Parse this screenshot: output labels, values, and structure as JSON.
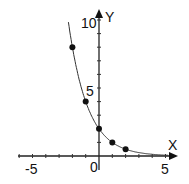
{
  "chart_data": {
    "type": "line",
    "title": "",
    "xlabel": "X",
    "ylabel": "Y",
    "x_ticks_labeled": [
      "-5",
      "0",
      "5"
    ],
    "y_ticks_labeled": [
      "5",
      "10"
    ],
    "xlim": [
      -6,
      5.5
    ],
    "ylim": [
      0,
      10.5
    ],
    "grid": false,
    "curve": "y = 2*(1/2)^x",
    "points": [
      {
        "x": -2,
        "y": 8
      },
      {
        "x": -1,
        "y": 4
      },
      {
        "x": 0,
        "y": 2
      },
      {
        "x": 1,
        "y": 1
      },
      {
        "x": 2,
        "y": 0.5
      }
    ]
  },
  "labels": {
    "x_axis": "X",
    "y_axis": "Y",
    "x_neg5": "-5",
    "x_0": "0",
    "x_5": "5",
    "y_5": "5",
    "y_10": "10"
  }
}
